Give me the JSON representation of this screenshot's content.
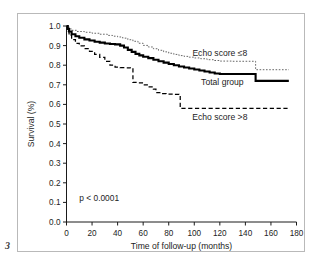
{
  "figure": {
    "number": "3"
  },
  "chart_data": {
    "type": "line",
    "title": "",
    "xlabel": "Time of follow-up (months)",
    "ylabel": "Survival (%)",
    "xlim": [
      0,
      180
    ],
    "ylim": [
      0.0,
      1.0
    ],
    "xticks": [
      0,
      20,
      40,
      60,
      80,
      100,
      120,
      140,
      160,
      180
    ],
    "xtick_labels": [
      "0",
      "20",
      "40",
      "60",
      "80",
      "100",
      "120",
      "140",
      "160",
      "180"
    ],
    "yticks": [
      0.0,
      0.1,
      0.2,
      0.3,
      0.4,
      0.5,
      0.6,
      0.7,
      0.8,
      0.9,
      1.0
    ],
    "ytick_labels": [
      "0.0",
      "0.1",
      "0.2",
      "0.3",
      "0.4",
      "0.5",
      "0.6",
      "0.7",
      "0.8",
      "0.9",
      "1.0"
    ],
    "grid": false,
    "legend_position": "inline-annotations",
    "annotations": [
      {
        "text": "p < 0.0001",
        "x": 10,
        "y": 0.105
      }
    ],
    "series": [
      {
        "name": "Echo score ≤8",
        "style": "dotted",
        "color": "#666666",
        "label_x": 120,
        "label_y": 0.845,
        "points": [
          [
            0,
            1.0
          ],
          [
            2,
            0.985
          ],
          [
            4,
            0.978
          ],
          [
            8,
            0.972
          ],
          [
            14,
            0.968
          ],
          [
            20,
            0.963
          ],
          [
            26,
            0.958
          ],
          [
            32,
            0.952
          ],
          [
            36,
            0.948
          ],
          [
            40,
            0.944
          ],
          [
            44,
            0.938
          ],
          [
            48,
            0.93
          ],
          [
            52,
            0.922
          ],
          [
            56,
            0.912
          ],
          [
            60,
            0.901
          ],
          [
            64,
            0.893
          ],
          [
            68,
            0.884
          ],
          [
            72,
            0.876
          ],
          [
            76,
            0.868
          ],
          [
            80,
            0.861
          ],
          [
            84,
            0.855
          ],
          [
            88,
            0.849
          ],
          [
            92,
            0.845
          ],
          [
            96,
            0.841
          ],
          [
            100,
            0.837
          ],
          [
            105,
            0.833
          ],
          [
            110,
            0.828
          ],
          [
            115,
            0.824
          ],
          [
            120,
            0.821
          ],
          [
            130,
            0.82
          ],
          [
            140,
            0.82
          ],
          [
            148,
            0.82
          ],
          [
            148,
            0.777
          ],
          [
            160,
            0.777
          ],
          [
            174,
            0.777
          ]
        ]
      },
      {
        "name": "Total group",
        "style": "solid",
        "color": "#000000",
        "label_x": 122,
        "label_y": 0.7,
        "points": [
          [
            0,
            1.0
          ],
          [
            1,
            0.985
          ],
          [
            2,
            0.972
          ],
          [
            4,
            0.958
          ],
          [
            7,
            0.948
          ],
          [
            10,
            0.94
          ],
          [
            14,
            0.932
          ],
          [
            18,
            0.926
          ],
          [
            22,
            0.92
          ],
          [
            26,
            0.915
          ],
          [
            30,
            0.911
          ],
          [
            34,
            0.908
          ],
          [
            38,
            0.906
          ],
          [
            42,
            0.9
          ],
          [
            45,
            0.89
          ],
          [
            48,
            0.878
          ],
          [
            51,
            0.868
          ],
          [
            54,
            0.858
          ],
          [
            57,
            0.85
          ],
          [
            60,
            0.843
          ],
          [
            64,
            0.836
          ],
          [
            68,
            0.828
          ],
          [
            72,
            0.82
          ],
          [
            76,
            0.813
          ],
          [
            80,
            0.806
          ],
          [
            84,
            0.8
          ],
          [
            88,
            0.793
          ],
          [
            92,
            0.788
          ],
          [
            96,
            0.783
          ],
          [
            100,
            0.778
          ],
          [
            104,
            0.773
          ],
          [
            108,
            0.768
          ],
          [
            112,
            0.763
          ],
          [
            116,
            0.758
          ],
          [
            120,
            0.755
          ],
          [
            130,
            0.755
          ],
          [
            140,
            0.755
          ],
          [
            148,
            0.755
          ],
          [
            148,
            0.72
          ],
          [
            160,
            0.72
          ],
          [
            174,
            0.72
          ]
        ]
      },
      {
        "name": "Echo score >8",
        "style": "dashed",
        "color": "#000000",
        "label_x": 120,
        "label_y": 0.52,
        "points": [
          [
            0,
            1.0
          ],
          [
            1,
            0.972
          ],
          [
            2,
            0.952
          ],
          [
            4,
            0.93
          ],
          [
            7,
            0.912
          ],
          [
            10,
            0.898
          ],
          [
            14,
            0.884
          ],
          [
            18,
            0.87
          ],
          [
            22,
            0.855
          ],
          [
            26,
            0.84
          ],
          [
            30,
            0.82
          ],
          [
            34,
            0.8
          ],
          [
            38,
            0.79
          ],
          [
            42,
            0.788
          ],
          [
            46,
            0.787
          ],
          [
            50,
            0.786
          ],
          [
            52,
            0.786
          ],
          [
            52,
            0.712
          ],
          [
            56,
            0.71
          ],
          [
            60,
            0.7
          ],
          [
            64,
            0.69
          ],
          [
            68,
            0.678
          ],
          [
            70,
            0.66
          ],
          [
            74,
            0.655
          ],
          [
            78,
            0.653
          ],
          [
            84,
            0.651
          ],
          [
            88,
            0.65
          ],
          [
            89,
            0.65
          ],
          [
            89,
            0.58
          ],
          [
            100,
            0.58
          ],
          [
            120,
            0.58
          ],
          [
            140,
            0.58
          ],
          [
            160,
            0.58
          ],
          [
            174,
            0.58
          ]
        ]
      }
    ]
  }
}
